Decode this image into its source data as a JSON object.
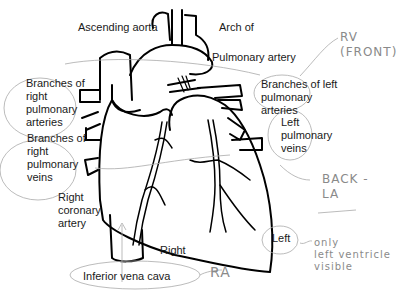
{
  "diagram": {
    "labels": {
      "ascending_aorta": "Ascending aorta",
      "arch_of": "Arch of",
      "pulmonary_artery": "Pulmonary artery",
      "branches_right_pulm_arteries": "Branches of\nright\npulmonary\narteries",
      "branches_left_pulm_arteries": "Branches of left\npulmonary\narteries",
      "left_pulmonary_veins": "Left\npulmonary\nveins",
      "branches_right_pulm_veins": "Branches of\nright\npulmonary\nveins",
      "right_coronary_artery": "Right\ncoronary\nartery",
      "right": "Right",
      "left": "Left",
      "inferior_vena_cava": "Inferior vena cava"
    },
    "annotations": {
      "rv_front": "RV\n(FRONT)",
      "back_la": "BACK -\nLA",
      "only_left": "only\nleft ventricle\nvisible",
      "ra": "RA"
    },
    "colors": {
      "ink": "#000000",
      "label": "#1a1a1a",
      "pencil": "#8a8a8a"
    }
  }
}
